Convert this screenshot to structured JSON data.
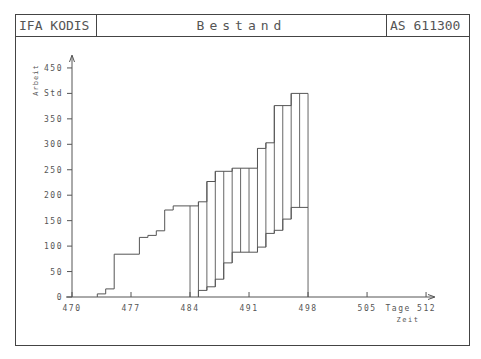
{
  "header": {
    "left": "IFA KODIS",
    "title": "Bestand",
    "right": "AS 611300"
  },
  "colors": {
    "line": "#555555",
    "frame": "#444444",
    "background": "#ffffff"
  },
  "chart_data": {
    "type": "line",
    "title": "Bestand",
    "xlabel": "Zeit",
    "xunit": "Tage",
    "ylabel": "Arbeit",
    "yunit": "Std",
    "xlim": [
      470,
      512
    ],
    "ylim": [
      0,
      450
    ],
    "xticks": [
      470,
      477,
      484,
      491,
      498,
      505,
      512
    ],
    "yticks": [
      0,
      50,
      100,
      150,
      200,
      250,
      300,
      350,
      400,
      450
    ],
    "ytick_labels": [
      "0",
      "50",
      "100",
      "150",
      "200",
      "250",
      "300",
      "350",
      "Std",
      "450"
    ],
    "xtick_labels": [
      "470",
      "477",
      "484",
      "491",
      "498",
      "505",
      "Tage 512"
    ],
    "grid": false,
    "series": [
      {
        "name": "Zugang bis Tag 484 (Treppe)",
        "step": true,
        "points": [
          [
            473,
            0
          ],
          [
            473,
            6
          ],
          [
            474,
            6
          ],
          [
            474,
            16
          ],
          [
            475,
            16
          ],
          [
            475,
            84
          ],
          [
            478,
            84
          ],
          [
            478,
            117
          ],
          [
            479,
            117
          ],
          [
            479,
            121
          ],
          [
            480,
            121
          ],
          [
            480,
            130
          ],
          [
            481,
            130
          ],
          [
            481,
            171
          ],
          [
            482,
            171
          ],
          [
            482,
            179
          ],
          [
            485,
            179
          ]
        ]
      },
      {
        "name": "Zugang (obere Kurve)",
        "step": true,
        "points": [
          [
            485,
            179
          ],
          [
            485,
            187
          ],
          [
            486,
            187
          ],
          [
            486,
            227
          ],
          [
            487,
            227
          ],
          [
            487,
            247
          ],
          [
            489,
            247
          ],
          [
            489,
            253
          ],
          [
            492,
            253
          ],
          [
            492,
            292
          ],
          [
            493,
            292
          ],
          [
            493,
            303
          ],
          [
            494,
            303
          ],
          [
            494,
            376
          ],
          [
            496,
            376
          ],
          [
            496,
            400
          ],
          [
            498,
            400
          ]
        ]
      },
      {
        "name": "Abgang (untere Kurve)",
        "step": true,
        "points": [
          [
            485,
            0
          ],
          [
            485,
            13
          ],
          [
            486,
            13
          ],
          [
            486,
            20
          ],
          [
            487,
            20
          ],
          [
            487,
            35
          ],
          [
            488,
            35
          ],
          [
            488,
            67
          ],
          [
            489,
            67
          ],
          [
            489,
            88
          ],
          [
            492,
            88
          ],
          [
            492,
            98
          ],
          [
            493,
            98
          ],
          [
            493,
            125
          ],
          [
            494,
            125
          ],
          [
            494,
            131
          ],
          [
            495,
            131
          ],
          [
            495,
            153
          ],
          [
            496,
            153
          ],
          [
            496,
            176
          ],
          [
            498,
            176
          ]
        ]
      }
    ],
    "vertical_lines": [
      {
        "x": 484,
        "from": 0,
        "to": 179
      },
      {
        "x": 485,
        "from": 0,
        "to": 187
      },
      {
        "x": 486,
        "from": 13,
        "to": 227
      },
      {
        "x": 487,
        "from": 20,
        "to": 247
      },
      {
        "x": 488,
        "from": 35,
        "to": 247
      },
      {
        "x": 489,
        "from": 67,
        "to": 253
      },
      {
        "x": 490,
        "from": 88,
        "to": 253
      },
      {
        "x": 491,
        "from": 88,
        "to": 253
      },
      {
        "x": 492,
        "from": 88,
        "to": 292
      },
      {
        "x": 493,
        "from": 98,
        "to": 303
      },
      {
        "x": 494,
        "from": 125,
        "to": 376
      },
      {
        "x": 495,
        "from": 131,
        "to": 376
      },
      {
        "x": 496,
        "from": 153,
        "to": 400
      },
      {
        "x": 497,
        "from": 176,
        "to": 400
      },
      {
        "x": 498,
        "from": 0,
        "to": 400
      }
    ]
  }
}
